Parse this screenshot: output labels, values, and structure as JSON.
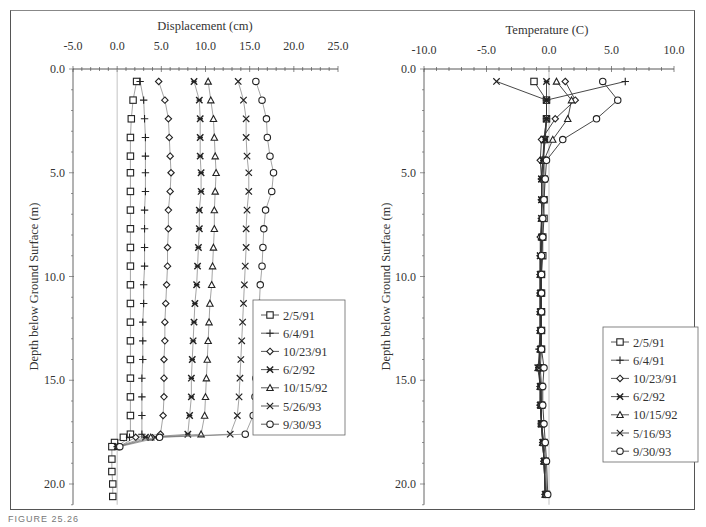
{
  "figure_caption": "FIGURE 25.26",
  "chart_data": [
    {
      "type": "scatter",
      "title": "Displacement (cm)",
      "xlabel": "Displacement (cm)",
      "ylabel": "Depth below Ground Surface (m)",
      "xlim": [
        -5.0,
        25.0
      ],
      "ylim": [
        0.0,
        21.0
      ],
      "y_inverted": true,
      "x_ticks": [
        "-5.0",
        "0.0",
        "5.0",
        "10.0",
        "15.0",
        "20.0",
        "25.0"
      ],
      "y_ticks": [
        "0.0",
        "5.0",
        "10.0",
        "15.0",
        "20.0"
      ],
      "grid": false,
      "legend_position": "lower right",
      "depths": [
        0.6,
        1.5,
        2.4,
        3.3,
        4.2,
        5.0,
        5.9,
        6.8,
        7.7,
        8.6,
        9.5,
        10.4,
        11.3,
        12.2,
        13.1,
        14.0,
        14.9,
        15.8,
        16.7,
        17.6
      ],
      "series": [
        {
          "name": "2/5/91",
          "marker": "square",
          "values": [
            2.2,
            1.8,
            1.6,
            1.5,
            1.5,
            1.5,
            1.5,
            1.5,
            1.5,
            1.5,
            1.5,
            1.5,
            1.5,
            1.5,
            1.5,
            1.5,
            1.5,
            1.5,
            1.5,
            1.5
          ],
          "tail": [
            [
              -0.3,
              18.0
            ],
            [
              -0.6,
              18.2
            ],
            [
              -0.6,
              18.8
            ],
            [
              -0.6,
              19.4
            ],
            [
              -0.5,
              20.0
            ],
            [
              -0.5,
              20.6
            ]
          ]
        },
        {
          "name": "6/4/91",
          "marker": "plus",
          "values": [
            2.6,
            3.0,
            3.1,
            3.2,
            3.2,
            3.2,
            3.2,
            3.1,
            3.1,
            3.1,
            3.1,
            3.0,
            3.0,
            2.9,
            2.9,
            2.9,
            2.8,
            2.8,
            2.8,
            2.8
          ],
          "tail": [
            [
              0.0,
              18.2
            ]
          ]
        },
        {
          "name": "10/23/91",
          "marker": "diamond",
          "values": [
            4.7,
            5.4,
            5.8,
            5.9,
            6.0,
            6.1,
            6.0,
            5.8,
            5.8,
            5.7,
            5.7,
            5.6,
            5.5,
            5.4,
            5.4,
            5.3,
            5.3,
            5.3,
            5.2,
            4.9
          ],
          "tail": [
            [
              0.2,
              18.2
            ]
          ]
        },
        {
          "name": "6/2/92",
          "marker": "asterisk",
          "values": [
            8.7,
            9.3,
            9.4,
            9.4,
            9.4,
            9.5,
            9.5,
            9.3,
            9.3,
            9.2,
            9.1,
            9.0,
            8.8,
            8.7,
            8.6,
            8.5,
            8.4,
            8.4,
            8.2,
            8.0
          ],
          "tail": [
            [
              0.0,
              18.2
            ]
          ]
        },
        {
          "name": "10/15/92",
          "marker": "triangle",
          "values": [
            10.3,
            10.6,
            10.9,
            11.0,
            11.1,
            11.2,
            11.1,
            11.0,
            11.0,
            10.9,
            10.8,
            10.7,
            10.5,
            10.4,
            10.3,
            10.2,
            10.1,
            10.0,
            9.9,
            9.5
          ],
          "tail": [
            [
              0.1,
              18.2
            ]
          ]
        },
        {
          "name": "5/26/93",
          "marker": "cross",
          "values": [
            13.7,
            14.3,
            14.6,
            14.6,
            14.7,
            14.9,
            14.9,
            14.7,
            14.6,
            14.6,
            14.5,
            14.4,
            14.3,
            14.2,
            14.1,
            14.0,
            13.9,
            13.8,
            13.6,
            12.8
          ],
          "tail": [
            [
              0.1,
              18.2
            ]
          ]
        },
        {
          "name": "9/30/93",
          "marker": "circle",
          "values": [
            15.7,
            16.4,
            16.9,
            17.0,
            17.3,
            17.7,
            17.5,
            16.8,
            16.6,
            16.5,
            16.4,
            16.2,
            16.1,
            16.0,
            15.9,
            15.8,
            15.7,
            15.6,
            15.4,
            14.5
          ],
          "tail": [
            [
              0.3,
              18.2
            ]
          ]
        }
      ],
      "bend_points": {
        "depth": 17.75,
        "values": {
          "2/5/91": 0.7,
          "6/4/91": 1.4,
          "10/23/91": 2.1,
          "6/2/92": 3.2,
          "10/15/92": 3.8,
          "5/26/93": 4.3,
          "9/30/93": 4.8
        }
      }
    },
    {
      "type": "scatter",
      "title": "Temperature (C)",
      "xlabel": "Temperature (C)",
      "ylabel": "Depth below Ground Surface (m)",
      "xlim": [
        -10.0,
        10.0
      ],
      "ylim": [
        0.0,
        21.0
      ],
      "y_inverted": true,
      "x_ticks": [
        "-10.0",
        "-5.0",
        "0.0",
        "5.0",
        "10.0"
      ],
      "y_ticks": [
        "0.0",
        "5.0",
        "10.0",
        "15.0",
        "20.0"
      ],
      "grid": false,
      "legend_position": "lower right",
      "depths": [
        0.6,
        1.5,
        2.4,
        3.4,
        4.4,
        5.3,
        6.3,
        7.2,
        8.1,
        9.0,
        9.9,
        10.8,
        11.7,
        12.6,
        13.5,
        14.4,
        15.3,
        16.2,
        17.1,
        18.0,
        18.9,
        20.5
      ],
      "series": [
        {
          "name": "2/5/91",
          "marker": "square",
          "values": [
            -1.2,
            -0.2,
            -0.2,
            -0.4,
            -0.4,
            -0.4,
            -0.4,
            -0.4,
            -0.5,
            -0.5,
            -0.6,
            -0.6,
            -0.6,
            -0.6,
            -0.6,
            -0.7,
            -0.6,
            -0.6,
            -0.6,
            -0.4,
            -0.3,
            -0.2
          ]
        },
        {
          "name": "6/4/91",
          "marker": "plus",
          "values": [
            6.1,
            -0.2,
            -0.2,
            -0.4,
            -0.5,
            -0.6,
            -0.6,
            -0.6,
            -0.6,
            -0.7,
            -0.7,
            -0.7,
            -0.7,
            -0.7,
            -0.8,
            -0.8,
            -0.7,
            -0.7,
            -0.6,
            -0.5,
            -0.4,
            -0.3
          ]
        },
        {
          "name": "10/23/91",
          "marker": "diamond",
          "values": [
            1.3,
            2.1,
            0.5,
            -0.6,
            -0.7,
            -0.6,
            -0.6,
            -0.6,
            -0.7,
            -0.7,
            -0.7,
            -0.7,
            -0.7,
            -0.7,
            -0.7,
            -0.8,
            -0.7,
            -0.7,
            -0.6,
            -0.5,
            -0.4,
            -0.3
          ]
        },
        {
          "name": "6/2/92",
          "marker": "asterisk",
          "values": [
            -0.2,
            -0.2,
            -0.2,
            -0.3,
            -0.5,
            -0.6,
            -0.6,
            -0.6,
            -0.6,
            -0.7,
            -0.7,
            -0.7,
            -0.7,
            -0.7,
            -0.7,
            -0.9,
            -0.7,
            -0.7,
            -0.6,
            -0.5,
            -0.4,
            -0.3
          ]
        },
        {
          "name": "10/15/92",
          "marker": "triangle",
          "values": [
            0.6,
            1.8,
            1.5,
            0.3,
            -0.4,
            -0.5,
            -0.5,
            -0.6,
            -0.6,
            -0.6,
            -0.7,
            -0.7,
            -0.7,
            -0.7,
            -0.7,
            -0.8,
            -0.7,
            -0.6,
            -0.6,
            -0.5,
            -0.4,
            -0.3
          ]
        },
        {
          "name": "5/16/93",
          "marker": "cross",
          "values": [
            -4.2,
            -0.2,
            -0.2,
            -0.3,
            -0.5,
            -0.6,
            -0.6,
            -0.6,
            -0.6,
            -0.7,
            -0.7,
            -0.7,
            -0.7,
            -0.7,
            -0.7,
            -0.8,
            -0.7,
            -0.7,
            -0.6,
            -0.5,
            -0.4,
            -0.3
          ]
        },
        {
          "name": "9/30/93",
          "marker": "circle",
          "values": [
            4.3,
            5.5,
            3.8,
            1.1,
            -0.2,
            -0.3,
            -0.4,
            -0.5,
            -0.5,
            -0.6,
            -0.6,
            -0.6,
            -0.6,
            -0.6,
            -0.6,
            -0.4,
            -0.5,
            -0.5,
            -0.4,
            -0.3,
            -0.2,
            -0.1
          ]
        }
      ]
    }
  ]
}
